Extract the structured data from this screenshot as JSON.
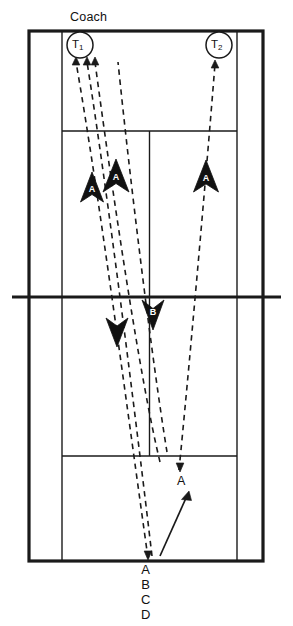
{
  "diagram": {
    "title_label": "Coach",
    "type": "badminton-court-drill",
    "court": {
      "outer_boundary": {
        "x": 29,
        "y": 31,
        "width": 234,
        "height": 530
      },
      "left_tramline_x": 62,
      "right_tramline_x": 237,
      "net_y": 297,
      "top_service_line_y": 131,
      "bottom_service_line_y": 456,
      "centre_line_x": 149.5,
      "line_color": "#1a1a1a",
      "background_color": "#ffffff"
    },
    "players": [
      {
        "name": "T1",
        "base": "T",
        "sub": "1",
        "cx": 80,
        "cy": 45,
        "r": 13
      },
      {
        "name": "T2",
        "base": "T",
        "sub": "2",
        "cx": 219,
        "cy": 45,
        "r": 13
      }
    ],
    "shuttle_paths": [
      {
        "id": "path-1",
        "label": "A",
        "from": [
          148,
          560
        ],
        "to": [
          76,
          57
        ]
      },
      {
        "id": "path-2",
        "label": "B",
        "from": [
          152,
          558
        ],
        "to": [
          87,
          57
        ]
      },
      {
        "id": "path-3",
        "label": "C",
        "from": [
          159,
          462
        ],
        "to": [
          95,
          57
        ]
      },
      {
        "id": "path-4",
        "label": "D",
        "from": [
          166,
          455
        ],
        "to": [
          118,
          57
        ]
      },
      {
        "id": "path-5",
        "label": "A",
        "from": [
          178,
          470
        ],
        "to": [
          215,
          60
        ]
      }
    ],
    "upward_arrowheads": [
      {
        "letter": "A",
        "x": 92,
        "y": 190,
        "size": 13
      },
      {
        "letter": "A",
        "x": 115,
        "y": 176,
        "size": 15
      },
      {
        "letter": "A",
        "x": 206,
        "y": 177,
        "size": 15
      }
    ],
    "downward_arrowheads": [
      {
        "letter": "",
        "x": 116,
        "y": 332,
        "size": 13
      },
      {
        "letter": "B",
        "x": 153,
        "y": 315,
        "size": 14
      }
    ],
    "tip_arrows_top": [
      {
        "x": 76,
        "y": 57
      },
      {
        "x": 87,
        "y": 57
      },
      {
        "x": 95,
        "y": 57
      },
      {
        "x": 215,
        "y": 60
      }
    ],
    "tip_arrows_bottom": [
      {
        "x": 148,
        "y": 560
      },
      {
        "x": 180,
        "y": 471
      }
    ],
    "movement_arrow": {
      "label": "A",
      "from": [
        160,
        556
      ],
      "to": [
        188,
        494
      ],
      "label_x": 181,
      "label_y": 479
    },
    "sequence_labels": [
      "A",
      "B",
      "C",
      "D"
    ],
    "sequence_position": {
      "x": 148,
      "y": 564
    }
  }
}
